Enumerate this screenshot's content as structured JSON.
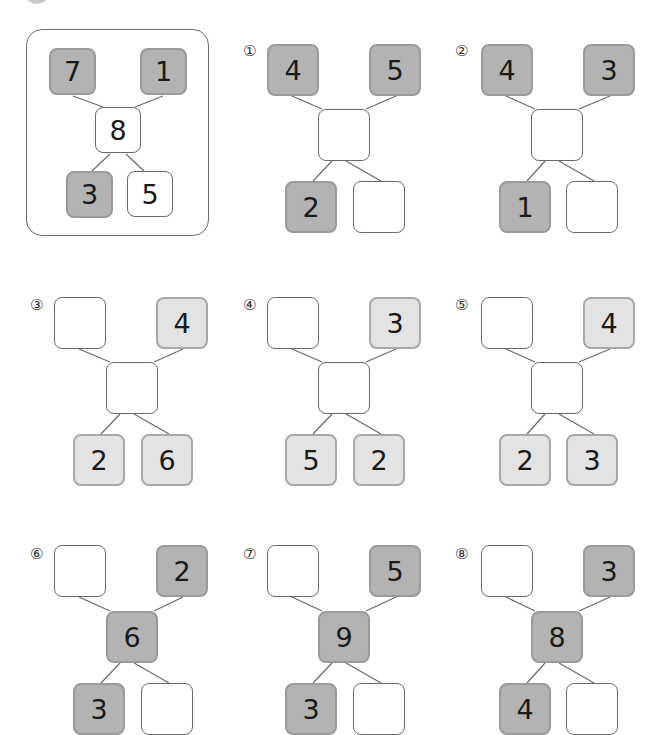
{
  "colors": {
    "dark_fill": "#b3b3b3",
    "light_fill": "#e3e3e3",
    "white_fill": "#ffffff",
    "line": "#6a6a6a"
  },
  "example": {
    "top_left": "7",
    "top_right": "1",
    "middle": "8",
    "bottom_left": "3",
    "bottom_right": "5"
  },
  "problems": [
    {
      "label": "①",
      "top_left": "4",
      "top_right": "5",
      "middle": "",
      "bottom_left": "2",
      "bottom_right": ""
    },
    {
      "label": "②",
      "top_left": "4",
      "top_right": "3",
      "middle": "",
      "bottom_left": "1",
      "bottom_right": ""
    },
    {
      "label": "③",
      "top_left": "",
      "top_right": "4",
      "middle": "",
      "bottom_left": "2",
      "bottom_right": "6"
    },
    {
      "label": "④",
      "top_left": "",
      "top_right": "3",
      "middle": "",
      "bottom_left": "5",
      "bottom_right": "2"
    },
    {
      "label": "⑤",
      "top_left": "",
      "top_right": "4",
      "middle": "",
      "bottom_left": "2",
      "bottom_right": "3"
    },
    {
      "label": "⑥",
      "top_left": "",
      "top_right": "2",
      "middle": "6",
      "bottom_left": "3",
      "bottom_right": ""
    },
    {
      "label": "⑦",
      "top_left": "",
      "top_right": "5",
      "middle": "9",
      "bottom_left": "3",
      "bottom_right": ""
    },
    {
      "label": "⑧",
      "top_left": "",
      "top_right": "3",
      "middle": "8",
      "bottom_left": "4",
      "bottom_right": ""
    }
  ]
}
